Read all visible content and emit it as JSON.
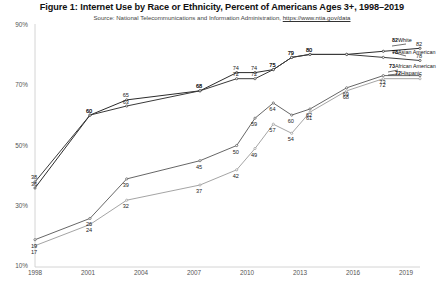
{
  "title": "Figure 1: Internet Use by Race or Ethnicity, Percent of Americans Ages 3+, 1998–2019",
  "source_prefix": "Source: National Telecommunications and Information Administration, ",
  "source_link": "https://www.ntia.gov/data",
  "axis": {
    "y_ticks": [
      "90%",
      "70%",
      "50%",
      "30%",
      "10%"
    ],
    "x_ticks": [
      "1998",
      "2001",
      "2004",
      "2007",
      "2010",
      "2013",
      "2016",
      "2019"
    ]
  },
  "end_labels": [
    {
      "value": "82",
      "name": "White"
    },
    {
      "value": "78",
      "name": "Asian American"
    },
    {
      "value": "73",
      "name": "African American"
    },
    {
      "value": "72",
      "name": "Hispanic"
    }
  ],
  "chart_data": {
    "type": "line",
    "title": "Figure 1: Internet Use by Race or Ethnicity, Percent of Americans Ages 3+, 1998–2019",
    "subtitle": "Source: National Telecommunications and Information Administration, https://www.ntia.gov/data",
    "xlabel": "",
    "ylabel": "",
    "xlim": [
      1998,
      2019
    ],
    "ylim": [
      10,
      90
    ],
    "yticks": [
      10,
      30,
      50,
      70,
      90
    ],
    "xticks": [
      1998,
      2001,
      2004,
      2007,
      2010,
      2013,
      2016,
      2019
    ],
    "grid": false,
    "legend": "right-endpoint-labels",
    "x": [
      1998,
      2001,
      2003,
      2007,
      2009,
      2010,
      2011,
      2012,
      2013,
      2015,
      2017,
      2019
    ],
    "series": [
      {
        "name": "White",
        "values": [
          36,
          60,
          65,
          68,
          74,
          74,
          75,
          79,
          80,
          80,
          81,
          82
        ],
        "labels": [
          "36",
          "60",
          "65",
          "68",
          "74",
          "74",
          "75",
          "79",
          "80",
          "",
          "",
          "82"
        ]
      },
      {
        "name": "Asian American",
        "values": [
          38,
          60,
          63,
          68,
          72,
          72,
          75,
          79,
          80,
          80,
          79,
          78
        ],
        "labels": [
          "38",
          "60",
          "63",
          "68",
          "72",
          "72",
          "75",
          "79",
          "80",
          "",
          "",
          "78"
        ]
      },
      {
        "name": "African American",
        "values": [
          19,
          26,
          39,
          45,
          50,
          59,
          64,
          60,
          62,
          69,
          73,
          73
        ],
        "labels": [
          "19",
          "26",
          "39",
          "45",
          "50",
          "59",
          "64",
          "60",
          "62",
          "69",
          "73",
          ""
        ]
      },
      {
        "name": "Hispanic",
        "values": [
          17,
          24,
          32,
          37,
          42,
          49,
          57,
          54,
          61,
          68,
          72,
          72
        ],
        "labels": [
          "17",
          "24",
          "32",
          "37",
          "42",
          "49",
          "57",
          "54",
          "61",
          "68",
          "72",
          ""
        ]
      }
    ]
  }
}
